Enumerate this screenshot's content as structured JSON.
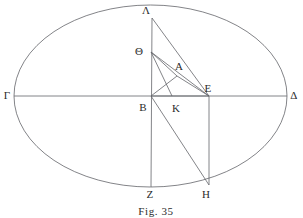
{
  "figure": {
    "caption": "Fig. 35",
    "caption_position": {
      "x": 156,
      "y": 211
    },
    "canvas": {
      "width": 303,
      "height": 218
    },
    "stroke_color": "#63656a",
    "text_color": "#2b2b2b",
    "background_color": "#ffffff",
    "stroke_width": 0.8
  },
  "ellipse": {
    "name": "main-ellipse",
    "center_x": 150.5,
    "center_y": 96,
    "radius_x": 136.5,
    "radius_y": 91
  },
  "points": [
    {
      "id": "Lambda",
      "label": "Λ",
      "x": 152,
      "y": 18,
      "label_x": 146,
      "label_y": 10
    },
    {
      "id": "Theta",
      "label": "Θ",
      "x": 151,
      "y": 52,
      "label_x": 139,
      "label_y": 51
    },
    {
      "id": "A",
      "label": "A",
      "x": 177,
      "y": 76,
      "label_x": 179,
      "label_y": 66
    },
    {
      "id": "Gamma",
      "label": "Γ",
      "x": 14,
      "y": 96,
      "label_x": 7,
      "label_y": 95
    },
    {
      "id": "Delta",
      "label": "Δ",
      "x": 287,
      "y": 96,
      "label_x": 294,
      "label_y": 95
    },
    {
      "id": "B",
      "label": "B",
      "x": 151,
      "y": 96,
      "label_x": 143,
      "label_y": 107
    },
    {
      "id": "K",
      "label": "K",
      "x": 172,
      "y": 96,
      "label_x": 176,
      "label_y": 108
    },
    {
      "id": "E",
      "label": "E",
      "x": 209,
      "y": 96,
      "label_x": 208,
      "label_y": 88
    },
    {
      "id": "Z",
      "label": "Z",
      "x": 151,
      "y": 187,
      "label_x": 150,
      "label_y": 194
    },
    {
      "id": "H",
      "label": "H",
      "x": 209,
      "y": 185,
      "label_x": 206,
      "label_y": 194
    }
  ],
  "segments": [
    {
      "id": "gamma-delta-axis",
      "from": "Gamma",
      "to": "Delta",
      "x1": 14,
      "y1": 96,
      "x2": 287,
      "y2": 96
    },
    {
      "id": "lambda-z-axis",
      "from": "Lambda",
      "to": "Z",
      "x1": 152,
      "y1": 18,
      "x2": 151,
      "y2": 187
    },
    {
      "id": "lambda-e",
      "from": "Lambda",
      "to": "E",
      "x1": 152,
      "y1": 18,
      "x2": 209,
      "y2": 96
    },
    {
      "id": "theta-e",
      "from": "Theta",
      "to": "E",
      "x1": 151,
      "y1": 52,
      "x2": 209,
      "y2": 96
    },
    {
      "id": "theta-k",
      "from": "Theta",
      "to": "K",
      "x1": 151,
      "y1": 52,
      "x2": 172,
      "y2": 96
    },
    {
      "id": "theta-a",
      "from": "Theta",
      "to": "A",
      "x1": 151,
      "y1": 52,
      "x2": 177,
      "y2": 76
    },
    {
      "id": "b-a-e",
      "from": "B",
      "to": "E",
      "x1": 151,
      "y1": 96,
      "x2": 209,
      "y2": 96
    },
    {
      "id": "b-to-a-ray",
      "from": "B",
      "to": "A",
      "x1": 151,
      "y1": 96,
      "x2": 177,
      "y2": 76
    },
    {
      "id": "a-to-e",
      "from": "A",
      "to": "E",
      "x1": 177,
      "y1": 76,
      "x2": 209,
      "y2": 96
    },
    {
      "id": "b-h",
      "from": "B",
      "to": "H",
      "x1": 151,
      "y1": 96,
      "x2": 209,
      "y2": 185
    },
    {
      "id": "e-h",
      "from": "E",
      "to": "H",
      "x1": 209,
      "y1": 96,
      "x2": 209,
      "y2": 185
    }
  ]
}
